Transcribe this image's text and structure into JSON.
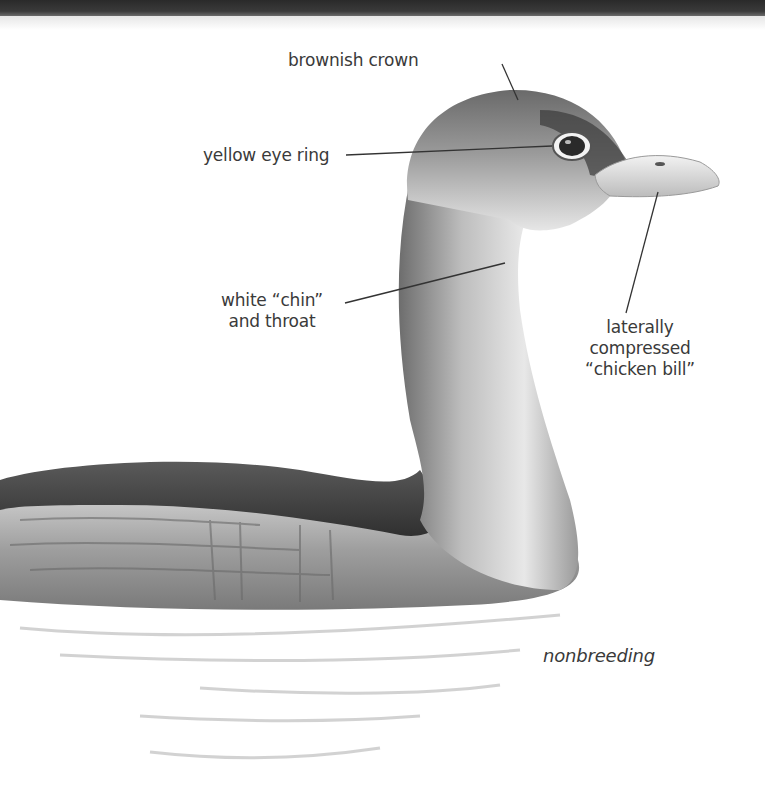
{
  "figure": {
    "plumage": "nonbreeding"
  },
  "labels": {
    "crown": "brownish crown",
    "eye_ring": "yellow eye ring",
    "chin_line1": "white “chin”",
    "chin_line2": "and throat",
    "bill_line1": "laterally",
    "bill_line2": "compressed",
    "bill_line3": "“chicken bill”",
    "caption": "nonbreeding"
  },
  "colors": {
    "topbar": "#2f2f2f",
    "background": "#ffffff",
    "leader_line": "#333333",
    "text": "#3a3a3a"
  }
}
